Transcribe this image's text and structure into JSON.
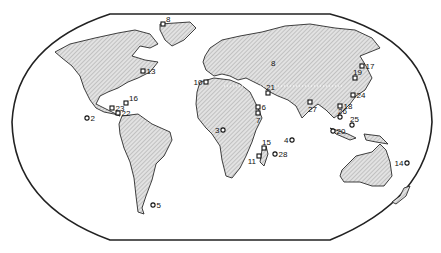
{
  "map": {
    "projection": "Robinson-style world outline",
    "hatch_color": "#9a9a9a",
    "outline_color": "#222222",
    "sites": [
      {
        "id": "2",
        "region": "eastern-pacific",
        "marker": "circle"
      },
      {
        "id": "3",
        "region": "west-africa-gulf-of-guinea",
        "marker": "circle"
      },
      {
        "id": "4",
        "region": "central-indian-ocean",
        "marker": "circle"
      },
      {
        "id": "5",
        "region": "south-atlantic-patagonia",
        "marker": "circle"
      },
      {
        "id": "6",
        "region": "red-sea",
        "marker": "square"
      },
      {
        "id": "7",
        "region": "gulf-of-aden",
        "marker": "square"
      },
      {
        "id": "8",
        "region": "greenland",
        "marker": "square"
      },
      {
        "id": "8",
        "region": "central-asia",
        "marker": "none"
      },
      {
        "id": "10",
        "region": "gibraltar",
        "marker": "square"
      },
      {
        "id": "11",
        "region": "madagascar",
        "marker": "square"
      },
      {
        "id": "13",
        "region": "north-atlantic-nova-scotia",
        "marker": "square"
      },
      {
        "id": "14",
        "region": "south-pacific",
        "marker": "circle"
      },
      {
        "id": "15",
        "region": "mozambique-channel",
        "marker": "square"
      },
      {
        "id": "16",
        "region": "caribbean",
        "marker": "square"
      },
      {
        "id": "17",
        "region": "sea-of-japan",
        "marker": "square"
      },
      {
        "id": "18",
        "region": "south-china-sea",
        "marker": "square"
      },
      {
        "id": "19",
        "region": "japan",
        "marker": "square"
      },
      {
        "id": "20",
        "region": "indonesia",
        "marker": "circle"
      },
      {
        "id": "21",
        "region": "persian-gulf",
        "marker": "square"
      },
      {
        "id": "22",
        "region": "panama",
        "marker": "square"
      },
      {
        "id": "23",
        "region": "gulf-of-honduras",
        "marker": "square"
      },
      {
        "id": "24",
        "region": "east-china-sea",
        "marker": "square"
      },
      {
        "id": "25",
        "region": "philippines",
        "marker": "circle"
      },
      {
        "id": "26",
        "region": "vietnam",
        "marker": "circle"
      },
      {
        "id": "27",
        "region": "bay-of-bengal",
        "marker": "square"
      },
      {
        "id": "28",
        "region": "mascarene-islands",
        "marker": "circle"
      }
    ]
  }
}
